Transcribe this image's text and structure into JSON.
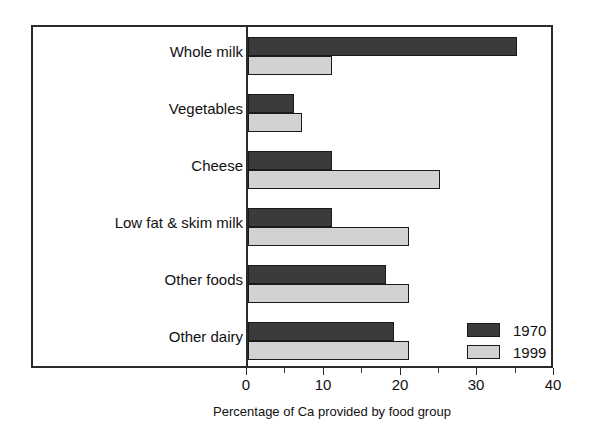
{
  "chart_data": {
    "type": "bar",
    "orientation": "horizontal",
    "title": "",
    "subtitle": "",
    "xlabel": "Percentage of Ca provided by food group",
    "ylabel": "",
    "xlim": [
      0,
      40
    ],
    "xticks": [
      0,
      10,
      20,
      30,
      40
    ],
    "xtick_labels": [
      "0",
      "10",
      "20",
      "30",
      "40"
    ],
    "minor_tick_interval": 5,
    "grid": false,
    "legend_position": "inside-right-lower",
    "categories": [
      "Whole milk",
      "Vegetables",
      "Cheese",
      "Low fat & skim milk",
      "Other foods",
      "Other dairy"
    ],
    "series": [
      {
        "name": "1970",
        "color": "#3b3b3b",
        "values": [
          35,
          6,
          11,
          11,
          18,
          19
        ]
      },
      {
        "name": "1999",
        "color": "#d2d2d2",
        "values": [
          11,
          7,
          25,
          21,
          21,
          21
        ]
      }
    ]
  },
  "legend": {
    "items": [
      {
        "label": "1970",
        "color": "#3b3b3b"
      },
      {
        "label": "1999",
        "color": "#d2d2d2"
      }
    ]
  },
  "axis": {
    "frame_color": "#2b2b2b",
    "zero_line_value": 0
  }
}
